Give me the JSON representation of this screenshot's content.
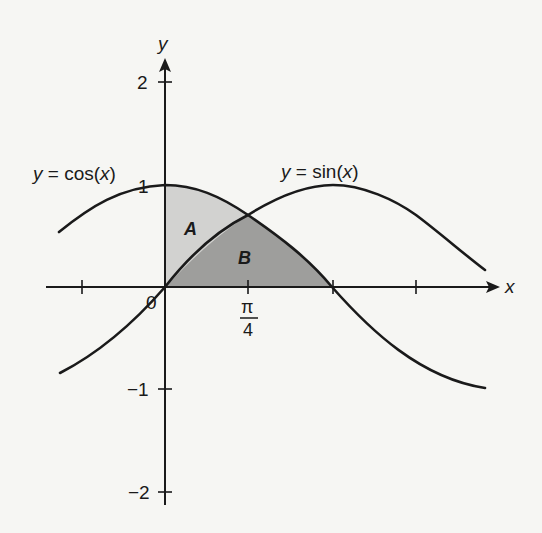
{
  "figure": {
    "type": "function-area-diagram",
    "axes": {
      "x_label": "x",
      "y_label": "y",
      "origin_label": "0",
      "y_ticks": [
        {
          "value": 2,
          "label": "2"
        },
        {
          "value": 1,
          "label": "1"
        },
        {
          "value": -1,
          "label": "−1"
        },
        {
          "value": -2,
          "label": "−2"
        }
      ],
      "x_ticks": [
        {
          "value": "-pi/4",
          "label": ""
        },
        {
          "value": "pi/4",
          "label_num": "π",
          "label_den": "4"
        },
        {
          "value": "pi/2",
          "label": ""
        },
        {
          "value": "3pi/4",
          "label": ""
        }
      ]
    },
    "curves": [
      {
        "name": "cos",
        "label": "y = cos(x)",
        "label_prefix": "y",
        "label_eq": " = cos(",
        "label_var": "x",
        "label_close": ")"
      },
      {
        "name": "sin",
        "label": "y = sin(x)",
        "label_prefix": "y",
        "label_eq": " = sin(",
        "label_var": "x",
        "label_close": ")"
      }
    ],
    "regions": [
      {
        "label": "A",
        "description": "between y-axis, cos(x) above and sin(x) below, 0 to π/4",
        "color": "#d2d2d0"
      },
      {
        "label": "B",
        "description": "under sin(x) from 0 to π/4 and under cos(x) from π/4 to π/2",
        "color": "#9e9e9c"
      }
    ],
    "colors": {
      "background": "#f6f6f3",
      "ink": "#1a1a1a",
      "region_a": "#d2d2d0",
      "region_b": "#9e9e9c"
    }
  }
}
